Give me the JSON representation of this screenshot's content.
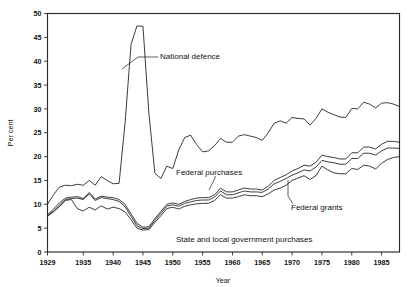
{
  "chart_data": {
    "type": "line",
    "title": "",
    "xlabel": "Year",
    "ylabel": "Per cent",
    "xlim": [
      1929,
      1988
    ],
    "ylim": [
      0,
      50
    ],
    "grid": false,
    "legend_position": "inline-annotations",
    "xticks": [
      1929,
      1935,
      1940,
      1945,
      1950,
      1955,
      1960,
      1965,
      1970,
      1975,
      1980,
      1985
    ],
    "xtick_labels": [
      "1929",
      "1935",
      "1940",
      "1945",
      "1950",
      "1955",
      "1960",
      "1965",
      "1970",
      "1975",
      "1980",
      "1985"
    ],
    "yticks": [
      0,
      5,
      10,
      15,
      20,
      25,
      30,
      35,
      40,
      45,
      50
    ],
    "ytick_labels": [
      "0",
      "5",
      "10",
      "15",
      "20",
      "25",
      "30",
      "35",
      "40",
      "45",
      "50"
    ],
    "x": [
      1929,
      1930,
      1931,
      1932,
      1933,
      1934,
      1935,
      1936,
      1937,
      1938,
      1939,
      1940,
      1941,
      1942,
      1943,
      1944,
      1945,
      1946,
      1947,
      1948,
      1949,
      1950,
      1951,
      1952,
      1953,
      1954,
      1955,
      1956,
      1957,
      1958,
      1959,
      1960,
      1961,
      1962,
      1963,
      1964,
      1965,
      1966,
      1967,
      1968,
      1969,
      1970,
      1971,
      1972,
      1973,
      1974,
      1975,
      1976,
      1977,
      1978,
      1979,
      1980,
      1981,
      1982,
      1983,
      1984,
      1985,
      1986,
      1987,
      1988
    ],
    "series": [
      {
        "name": "Total government expenditure",
        "annotation": "",
        "values": [
          10.0,
          12.0,
          13.6,
          14.0,
          13.9,
          14.2,
          14.0,
          15.0,
          14.0,
          15.8,
          15.0,
          14.3,
          14.4,
          27.0,
          43.5,
          47.4,
          47.3,
          29.0,
          16.5,
          15.4,
          18.0,
          17.5,
          21.4,
          24.0,
          24.5,
          22.5,
          21.0,
          21.2,
          22.3,
          23.8,
          23.0,
          23.0,
          24.3,
          24.6,
          24.3,
          24.0,
          23.4,
          25.0,
          27.0,
          27.5,
          27.0,
          28.2,
          28.0,
          27.9,
          26.6,
          28.0,
          30.0,
          29.3,
          28.8,
          28.3,
          28.2,
          30.1,
          30.0,
          31.4,
          31.0,
          30.2,
          31.2,
          31.3,
          31.0,
          30.5
        ]
      },
      {
        "name": "Federal purchases",
        "annotation": "Federal purchases",
        "values": [
          7.8,
          9.0,
          10.3,
          11.3,
          11.5,
          11.6,
          11.2,
          12.5,
          11.1,
          11.7,
          11.5,
          11.4,
          11.0,
          10.0,
          8.0,
          6.0,
          5.2,
          5.3,
          7.0,
          8.5,
          10.0,
          10.3,
          10.0,
          10.6,
          11.0,
          11.3,
          11.4,
          11.4,
          12.0,
          13.4,
          12.6,
          12.6,
          13.0,
          13.4,
          13.2,
          13.2,
          13.0,
          13.8,
          15.0,
          15.6,
          16.2,
          17.0,
          17.5,
          18.2,
          18.0,
          18.8,
          20.3,
          20.0,
          19.8,
          19.5,
          19.5,
          20.8,
          20.8,
          22.0,
          22.0,
          21.6,
          22.6,
          23.2,
          23.2,
          23.0
        ]
      },
      {
        "name": "Federal grants",
        "annotation": "Federal grants",
        "values": [
          7.6,
          8.6,
          9.8,
          11.0,
          11.2,
          11.3,
          11.0,
          12.2,
          10.8,
          11.4,
          11.2,
          11.0,
          10.6,
          9.5,
          7.5,
          5.5,
          4.9,
          5.0,
          6.6,
          8.1,
          9.6,
          9.9,
          9.6,
          10.2,
          10.5,
          10.8,
          10.9,
          10.9,
          11.5,
          12.8,
          12.0,
          12.0,
          12.4,
          12.8,
          12.6,
          12.6,
          12.5,
          13.2,
          14.3,
          14.8,
          15.4,
          16.1,
          16.6,
          17.2,
          17.0,
          17.8,
          19.2,
          18.9,
          18.7,
          18.4,
          18.4,
          19.6,
          19.6,
          20.7,
          20.7,
          20.3,
          21.2,
          21.8,
          21.8,
          21.7
        ]
      },
      {
        "name": "State and local government purchases",
        "annotation": "State and local government purchases",
        "values": [
          7.5,
          8.4,
          9.5,
          10.8,
          11.0,
          9.1,
          8.6,
          9.4,
          8.8,
          9.7,
          9.0,
          9.4,
          9.1,
          8.4,
          6.8,
          5.0,
          4.6,
          4.7,
          6.2,
          7.6,
          9.1,
          9.4,
          9.0,
          9.6,
          9.9,
          10.1,
          10.2,
          10.2,
          10.8,
          12.0,
          11.3,
          11.3,
          11.6,
          12.0,
          11.8,
          11.8,
          11.6,
          12.2,
          13.0,
          13.4,
          14.0,
          15.0,
          15.5,
          16.0,
          15.2,
          16.0,
          18.0,
          17.2,
          16.6,
          16.4,
          16.4,
          17.5,
          17.3,
          18.2,
          18.0,
          17.4,
          18.6,
          19.4,
          19.8,
          20.0
        ]
      }
    ],
    "annotations": [
      {
        "text": "National defence",
        "x_px": 160,
        "y_px": 56
      },
      {
        "text": "Federal purchases",
        "x_px": 176,
        "y_px": 172
      },
      {
        "text": "Federal grants",
        "x_px": 291,
        "y_px": 207
      },
      {
        "text": "State and local government purchases",
        "x_px": 176,
        "y_px": 239
      }
    ]
  },
  "axes": {
    "ylabel": "Per cent",
    "xlabel": "Year"
  },
  "colors": {
    "line": "#1a1a1a",
    "frame": "#2b2b2b",
    "background": "#ffffff"
  }
}
